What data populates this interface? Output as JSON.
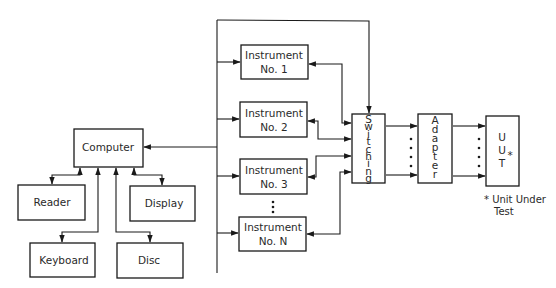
{
  "diagram": {
    "computer": "Computer",
    "peripherals": {
      "reader": "Reader",
      "display": "Display",
      "keyboard": "Keyboard",
      "disc": "Disc"
    },
    "instruments": [
      {
        "line1": "Instrument",
        "line2": "No. 1"
      },
      {
        "line1": "Instrument",
        "line2": "No. 2"
      },
      {
        "line1": "Instrument",
        "line2": "No. 3"
      },
      {
        "line1": "Instrument",
        "line2": "No. N"
      }
    ],
    "switching": "Switching",
    "adapter": "Adapter",
    "uut": "UUT",
    "uut_mark": "*",
    "footnote": {
      "line1": "* Unit Under",
      "line2": "Test"
    }
  }
}
